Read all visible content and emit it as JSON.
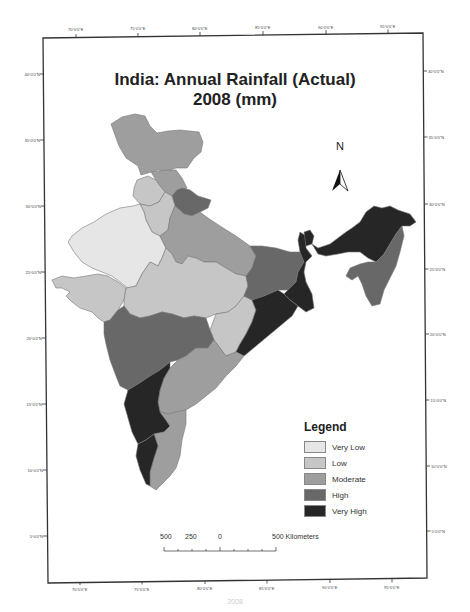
{
  "title": {
    "line1": "India: Annual Rainfall (Actual)",
    "line2": "2008 (mm)"
  },
  "north_arrow": {
    "label": "N"
  },
  "legend": {
    "title": "Legend",
    "items": [
      {
        "label": "Very Low",
        "color": "#e6e6e6"
      },
      {
        "label": "Low",
        "color": "#c6c6c6"
      },
      {
        "label": "Moderate",
        "color": "#9e9e9e"
      },
      {
        "label": "High",
        "color": "#686868"
      },
      {
        "label": "Very High",
        "color": "#262626"
      }
    ]
  },
  "scale_bar": {
    "labels": [
      "500",
      "250",
      "0",
      "500 Kilometers"
    ]
  },
  "axes": {
    "top_ticks": [
      "70°0'0\"E",
      "75°0'0\"E",
      "80°0'0\"E",
      "85°0'0\"E",
      "90°0'0\"E",
      "95°0'0\"E"
    ],
    "bottom_ticks": [
      "70°0'0\"E",
      "75°0'0\"E",
      "80°0'0\"E",
      "85°0'0\"E",
      "90°0'0\"E",
      "95°0'0\"E"
    ],
    "left_ticks": [
      "40°0'0\"N",
      "35°0'0\"N",
      "30°0'0\"N",
      "25°0'0\"N",
      "20°0'0\"N",
      "15°0'0\"N",
      "10°0'0\"N",
      "5°0'0\"N"
    ],
    "right_ticks": [
      "40°0'0\"N",
      "35°0'0\"N",
      "30°0'0\"N",
      "25°0'0\"N",
      "20°0'0\"N",
      "15°0'0\"N",
      "10°0'0\"N",
      "5°0'0\"N"
    ]
  },
  "caption": "2008"
}
